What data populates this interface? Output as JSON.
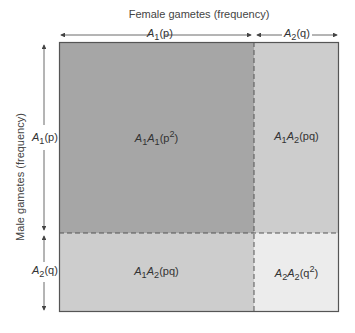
{
  "title_top": "Female gametes (frequency)",
  "title_side": "Male gametes (frequency)",
  "female_alleles": [
    {
      "allele": "A",
      "sub": "1",
      "freq": "(p)"
    },
    {
      "allele": "A",
      "sub": "2",
      "freq": "(q)"
    }
  ],
  "male_alleles": [
    {
      "allele": "A",
      "sub": "1",
      "freq": "(p)"
    },
    {
      "allele": "A",
      "sub": "2",
      "freq": "(q)"
    }
  ],
  "cells": {
    "a1a1": {
      "g1": "A",
      "s1": "1",
      "g2": "A",
      "s2": "1",
      "freq_pre": "(p",
      "sup": "2",
      "freq_post": ")"
    },
    "a1a2_top": {
      "g1": "A",
      "s1": "1",
      "g2": "A",
      "s2": "2",
      "freq_pre": "(pq",
      "sup": "",
      "freq_post": ")"
    },
    "a1a2_bottom": {
      "g1": "A",
      "s1": "1",
      "g2": "A",
      "s2": "2",
      "freq_pre": "(pq",
      "sup": "",
      "freq_post": ")"
    },
    "a2a2": {
      "g1": "A",
      "s1": "2",
      "g2": "A",
      "s2": "2",
      "freq_pre": "(q",
      "sup": "2",
      "freq_post": ")"
    }
  },
  "colors": {
    "a1a1": "#a6a6a6",
    "a1a2": "#cdcdcd",
    "a2a2": "#ececec",
    "border": "#555555"
  }
}
